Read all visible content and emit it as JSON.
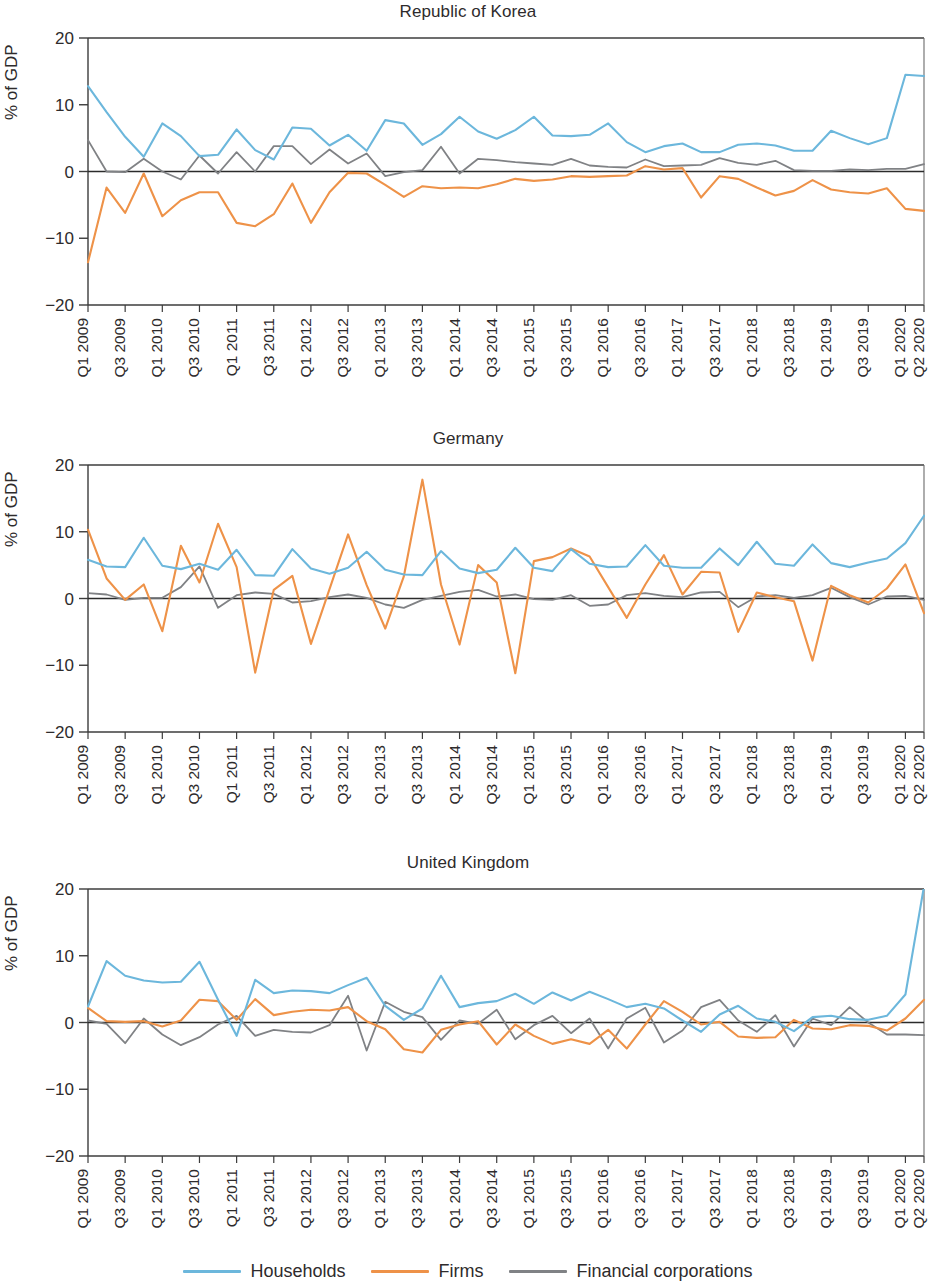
{
  "figure": {
    "ylabel": "% of GDP",
    "yticks": [
      20,
      10,
      0,
      -10,
      -20
    ],
    "ytick_labels": [
      "20",
      "10",
      "0",
      "-10",
      "-20"
    ],
    "ylim": [
      -20,
      20
    ],
    "grid": false,
    "legend_position": "bottom-center"
  },
  "legend": {
    "items": [
      {
        "label": "Households",
        "color": "#6cb7dc",
        "icon": "line-swatch-icon"
      },
      {
        "label": "Firms",
        "color": "#ee9248",
        "icon": "line-swatch-icon"
      },
      {
        "label": "Financial corporations",
        "color": "#808285",
        "icon": "line-swatch-icon"
      }
    ]
  },
  "xtick_labels": [
    "Q1 2009",
    "Q3 2009",
    "Q1 2010",
    "Q3 2010",
    "Q1 2011",
    "Q3 2011",
    "Q1 2012",
    "Q3 2012",
    "Q1 2013",
    "Q3 2013",
    "Q1 2014",
    "Q3 2014",
    "Q1 2015",
    "Q3 2015",
    "Q1 2016",
    "Q3 2016",
    "Q1 2017",
    "Q3 2017",
    "Q1 2018",
    "Q3 2018",
    "Q1 2019",
    "Q3 2019",
    "Q1 2020",
    "Q2 2020"
  ],
  "x_all": [
    "Q1 2009",
    "Q2 2009",
    "Q3 2009",
    "Q4 2009",
    "Q1 2010",
    "Q2 2010",
    "Q3 2010",
    "Q4 2010",
    "Q1 2011",
    "Q2 2011",
    "Q3 2011",
    "Q4 2011",
    "Q1 2012",
    "Q2 2012",
    "Q3 2012",
    "Q4 2012",
    "Q1 2013",
    "Q2 2013",
    "Q3 2013",
    "Q4 2013",
    "Q1 2014",
    "Q2 2014",
    "Q3 2014",
    "Q4 2014",
    "Q1 2015",
    "Q2 2015",
    "Q3 2015",
    "Q4 2015",
    "Q1 2016",
    "Q2 2016",
    "Q3 2016",
    "Q4 2016",
    "Q1 2017",
    "Q2 2017",
    "Q3 2017",
    "Q4 2017",
    "Q1 2018",
    "Q2 2018",
    "Q3 2018",
    "Q4 2018",
    "Q1 2019",
    "Q2 2019",
    "Q3 2019",
    "Q4 2019",
    "Q1 2020",
    "Q2 2020"
  ],
  "chart_data": [
    {
      "type": "line",
      "title": "Republic of Korea",
      "xlabel": "",
      "ylabel": "% of GDP",
      "ylim": [
        -20,
        20
      ],
      "yticks": [
        -20,
        -10,
        0,
        10,
        20
      ],
      "grid": false,
      "categories": [
        "Q1 2009",
        "Q2 2009",
        "Q3 2009",
        "Q4 2009",
        "Q1 2010",
        "Q2 2010",
        "Q3 2010",
        "Q4 2010",
        "Q1 2011",
        "Q2 2011",
        "Q3 2011",
        "Q4 2011",
        "Q1 2012",
        "Q2 2012",
        "Q3 2012",
        "Q4 2012",
        "Q1 2013",
        "Q2 2013",
        "Q3 2013",
        "Q4 2013",
        "Q1 2014",
        "Q2 2014",
        "Q3 2014",
        "Q4 2014",
        "Q1 2015",
        "Q2 2015",
        "Q3 2015",
        "Q4 2015",
        "Q1 2016",
        "Q2 2016",
        "Q3 2016",
        "Q4 2016",
        "Q1 2017",
        "Q2 2017",
        "Q3 2017",
        "Q4 2017",
        "Q1 2018",
        "Q2 2018",
        "Q3 2018",
        "Q4 2018",
        "Q1 2019",
        "Q2 2019",
        "Q3 2019",
        "Q4 2019",
        "Q1 2020",
        "Q2 2020"
      ],
      "series": [
        {
          "name": "Households",
          "color": "#6cb7dc",
          "values": [
            12.8,
            8.9,
            5.2,
            2.2,
            7.2,
            5.3,
            2.3,
            2.5,
            6.3,
            3.2,
            1.8,
            6.6,
            6.4,
            3.9,
            5.5,
            3.1,
            7.7,
            7.2,
            4.0,
            5.6,
            8.2,
            6.0,
            4.9,
            6.2,
            8.2,
            5.4,
            5.3,
            5.5,
            7.2,
            4.4,
            2.9,
            3.8,
            4.2,
            2.9,
            2.9,
            4.0,
            4.2,
            3.9,
            3.1,
            3.1,
            6.1,
            5.0,
            4.1,
            5.0,
            14.5,
            14.3
          ]
        },
        {
          "name": "Firms",
          "color": "#ee9248",
          "values": [
            -13.6,
            -2.4,
            -6.2,
            -0.3,
            -6.7,
            -4.3,
            -3.1,
            -3.1,
            -7.7,
            -8.2,
            -6.4,
            -1.8,
            -7.7,
            -3.1,
            -0.2,
            -0.3,
            -2.0,
            -3.8,
            -2.2,
            -2.5,
            -2.4,
            -2.5,
            -1.9,
            -1.1,
            -1.4,
            -1.2,
            -0.7,
            -0.8,
            -0.7,
            -0.6,
            0.8,
            0.3,
            0.5,
            -3.9,
            -0.7,
            -1.1,
            -2.4,
            -3.6,
            -2.9,
            -1.3,
            -2.7,
            -3.1,
            -3.3,
            -2.5,
            -5.6,
            -5.9
          ]
        },
        {
          "name": "Financial corporations",
          "color": "#808285",
          "values": [
            4.7,
            0.0,
            -0.1,
            1.9,
            0.0,
            -1.2,
            2.4,
            -0.3,
            2.9,
            0.0,
            3.8,
            3.8,
            1.1,
            3.3,
            1.2,
            2.7,
            -0.7,
            -0.1,
            0.2,
            3.7,
            -0.3,
            1.9,
            1.7,
            1.4,
            1.2,
            1.0,
            1.9,
            0.9,
            0.7,
            0.6,
            1.8,
            0.8,
            0.9,
            1.0,
            2.0,
            1.3,
            1.0,
            1.6,
            0.2,
            0.1,
            0.1,
            0.3,
            0.2,
            0.4,
            0.4,
            1.1
          ]
        }
      ]
    },
    {
      "type": "line",
      "title": "Germany",
      "xlabel": "",
      "ylabel": "% of GDP",
      "ylim": [
        -20,
        20
      ],
      "yticks": [
        -20,
        -10,
        0,
        10,
        20
      ],
      "grid": false,
      "categories": [
        "Q1 2009",
        "Q2 2009",
        "Q3 2009",
        "Q4 2009",
        "Q1 2010",
        "Q2 2010",
        "Q3 2010",
        "Q4 2010",
        "Q1 2011",
        "Q2 2011",
        "Q3 2011",
        "Q4 2011",
        "Q1 2012",
        "Q2 2012",
        "Q3 2012",
        "Q4 2012",
        "Q1 2013",
        "Q2 2013",
        "Q3 2013",
        "Q4 2013",
        "Q1 2014",
        "Q2 2014",
        "Q3 2014",
        "Q4 2014",
        "Q1 2015",
        "Q2 2015",
        "Q3 2015",
        "Q4 2015",
        "Q1 2016",
        "Q2 2016",
        "Q3 2016",
        "Q4 2016",
        "Q1 2017",
        "Q2 2017",
        "Q3 2017",
        "Q4 2017",
        "Q1 2018",
        "Q2 2018",
        "Q3 2018",
        "Q4 2018",
        "Q1 2019",
        "Q2 2019",
        "Q3 2019",
        "Q4 2019",
        "Q1 2020",
        "Q2 2020"
      ],
      "series": [
        {
          "name": "Households",
          "color": "#6cb7dc",
          "values": [
            5.8,
            4.8,
            4.7,
            9.1,
            4.9,
            4.4,
            5.2,
            4.3,
            7.3,
            3.5,
            3.4,
            7.4,
            4.5,
            3.7,
            4.6,
            7.0,
            4.3,
            3.6,
            3.5,
            7.1,
            4.5,
            3.8,
            4.3,
            7.6,
            4.6,
            4.1,
            7.4,
            5.2,
            4.7,
            4.8,
            8.0,
            4.9,
            4.6,
            4.6,
            7.5,
            5.0,
            8.5,
            5.2,
            4.9,
            8.1,
            5.3,
            4.7,
            5.4,
            6.0,
            8.3,
            12.4
          ]
        },
        {
          "name": "Firms",
          "color": "#ee9248",
          "values": [
            10.3,
            3.0,
            -0.2,
            2.1,
            -4.9,
            7.9,
            2.4,
            11.2,
            4.7,
            -11.1,
            1.3,
            3.4,
            -6.8,
            1.4,
            9.6,
            2.0,
            -4.5,
            3.3,
            17.8,
            2.1,
            -6.9,
            5.0,
            2.4,
            -11.2,
            5.6,
            6.2,
            7.5,
            6.3,
            1.7,
            -2.9,
            2.1,
            6.5,
            0.6,
            4.0,
            3.9,
            -5.0,
            0.9,
            0.2,
            -0.4,
            -9.3,
            1.9,
            0.5,
            -0.6,
            1.5,
            5.1,
            -2.2
          ]
        },
        {
          "name": "Financial corporations",
          "color": "#808285",
          "values": [
            0.8,
            0.6,
            -0.2,
            0.1,
            0.1,
            1.7,
            4.8,
            -1.4,
            0.5,
            0.9,
            0.7,
            -0.6,
            -0.4,
            0.2,
            0.6,
            0.1,
            -0.9,
            -1.4,
            -0.2,
            0.4,
            1.0,
            1.3,
            0.3,
            0.6,
            -0.1,
            -0.2,
            0.5,
            -1.1,
            -0.9,
            0.5,
            0.8,
            0.4,
            0.2,
            0.9,
            1.0,
            -1.3,
            0.3,
            0.5,
            0.1,
            0.5,
            1.6,
            0.2,
            -0.9,
            0.3,
            0.4,
            -0.2
          ]
        }
      ]
    },
    {
      "type": "line",
      "title": "United Kingdom",
      "xlabel": "",
      "ylabel": "% of GDP",
      "ylim": [
        -20,
        20
      ],
      "yticks": [
        -20,
        -10,
        0,
        10,
        20
      ],
      "grid": false,
      "categories": [
        "Q1 2009",
        "Q2 2009",
        "Q3 2009",
        "Q4 2009",
        "Q1 2010",
        "Q2 2010",
        "Q3 2010",
        "Q4 2010",
        "Q1 2011",
        "Q2 2011",
        "Q3 2011",
        "Q4 2011",
        "Q1 2012",
        "Q2 2012",
        "Q3 2012",
        "Q4 2012",
        "Q1 2013",
        "Q2 2013",
        "Q3 2013",
        "Q4 2013",
        "Q1 2014",
        "Q2 2014",
        "Q3 2014",
        "Q4 2014",
        "Q1 2015",
        "Q2 2015",
        "Q3 2015",
        "Q4 2015",
        "Q1 2016",
        "Q2 2016",
        "Q3 2016",
        "Q4 2016",
        "Q1 2017",
        "Q2 2017",
        "Q3 2017",
        "Q4 2017",
        "Q1 2018",
        "Q2 2018",
        "Q3 2018",
        "Q4 2018",
        "Q1 2019",
        "Q2 2019",
        "Q3 2019",
        "Q4 2019",
        "Q1 2020",
        "Q2 2020"
      ],
      "series": [
        {
          "name": "Households",
          "color": "#6cb7dc",
          "values": [
            2.4,
            9.2,
            7.0,
            6.3,
            6.0,
            6.1,
            9.1,
            3.4,
            -2.0,
            6.4,
            4.4,
            4.8,
            4.7,
            4.4,
            5.6,
            6.7,
            2.5,
            0.4,
            2.1,
            7.0,
            2.3,
            2.9,
            3.2,
            4.3,
            2.8,
            4.5,
            3.3,
            4.6,
            3.5,
            2.3,
            2.8,
            2.1,
            0.3,
            -1.4,
            1.2,
            2.5,
            0.6,
            0.1,
            -1.3,
            0.8,
            1.0,
            0.5,
            0.4,
            1.0,
            4.2,
            20.4
          ]
        },
        {
          "name": "Firms",
          "color": "#ee9248",
          "values": [
            2.2,
            0.2,
            0.1,
            0.2,
            -0.6,
            0.3,
            3.4,
            3.2,
            0.4,
            3.5,
            1.1,
            1.6,
            1.9,
            1.8,
            2.3,
            0.2,
            -1.0,
            -4.0,
            -4.5,
            -1.1,
            -0.3,
            0.2,
            -3.3,
            -0.3,
            -2.0,
            -3.2,
            -2.5,
            -3.2,
            -1.1,
            -3.9,
            -0.3,
            3.2,
            1.6,
            -0.3,
            0.1,
            -2.1,
            -2.3,
            -2.2,
            0.4,
            -0.9,
            -1.0,
            -0.4,
            -0.5,
            -1.2,
            0.6,
            3.4
          ]
        },
        {
          "name": "Financial corporations",
          "color": "#808285",
          "values": [
            0.3,
            -0.2,
            -3.1,
            0.6,
            -1.8,
            -3.4,
            -2.2,
            -0.3,
            1.0,
            -2.0,
            -1.1,
            -1.4,
            -1.5,
            -0.4,
            4.0,
            -4.2,
            3.1,
            1.6,
            0.8,
            -2.6,
            0.3,
            -0.2,
            1.9,
            -2.5,
            -0.4,
            1.0,
            -1.6,
            0.6,
            -3.9,
            0.6,
            2.2,
            -3.0,
            -1.2,
            2.3,
            3.4,
            0.3,
            -1.4,
            1.1,
            -3.6,
            0.6,
            -0.4,
            2.3,
            0.0,
            -1.8,
            -1.8,
            -1.9
          ]
        }
      ]
    }
  ]
}
